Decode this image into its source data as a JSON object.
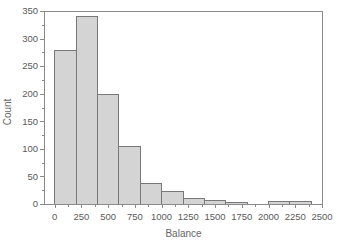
{
  "chart_data": {
    "type": "bar",
    "subtype": "histogram",
    "title": "",
    "xlabel": "Balance",
    "ylabel": "Count",
    "bin_width": 200,
    "bin_edges": [
      0,
      200,
      400,
      600,
      800,
      1000,
      1200,
      1400,
      1600,
      1800,
      2000,
      2200,
      2400
    ],
    "counts": [
      278,
      340,
      198,
      105,
      38,
      23,
      10,
      7,
      3,
      0,
      5,
      5
    ],
    "xlim": [
      -100,
      2500
    ],
    "ylim": [
      0,
      350
    ],
    "x_major_ticks": [
      0,
      250,
      500,
      750,
      1000,
      1250,
      1500,
      1750,
      2000,
      2250,
      2500
    ],
    "x_minor_ticks": [
      125,
      375,
      625,
      875,
      1125,
      1375,
      1625,
      1875,
      2125,
      2375
    ],
    "y_major_ticks": [
      0,
      50,
      100,
      150,
      200,
      250,
      300,
      350
    ],
    "y_minor_ticks": [
      25,
      75,
      125,
      175,
      225,
      275,
      325
    ],
    "grid": false,
    "legend": null,
    "frame_box": true,
    "colors": {
      "bar_fill": "#d4d4d4",
      "bar_stroke": "#787878",
      "frame": "#8a8a8a",
      "tick": "#8a8a8a",
      "tick_label": "#5a5a5a",
      "axis_label": "#666666",
      "background": "#ffffff"
    }
  }
}
